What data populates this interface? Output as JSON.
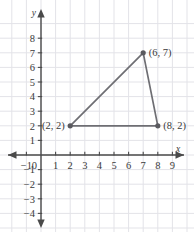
{
  "chart_data": {
    "type": "scatter",
    "title": "",
    "xlabel": "x",
    "ylabel": "y",
    "xlim": [
      -1.6,
      9.8
    ],
    "ylim": [
      -4.8,
      8.6
    ],
    "grid": true,
    "legend_position": "none",
    "x_ticks": [
      "-1",
      "0",
      "1",
      "2",
      "3",
      "4",
      "5",
      "6",
      "7",
      "8",
      "9"
    ],
    "y_ticks": [
      "8",
      "7",
      "6",
      "5",
      "4",
      "3",
      "2",
      "1",
      "-1",
      "-2",
      "-3",
      "-4"
    ],
    "origin_label": "0",
    "points": [
      {
        "label": "(2, 2)",
        "x": 2,
        "y": 2,
        "label_side": "left"
      },
      {
        "label": "(6, 7)",
        "x": 7,
        "y": 7,
        "label_side": "right"
      },
      {
        "label": "(8, 2)",
        "x": 8,
        "y": 2,
        "label_side": "right"
      }
    ],
    "shape": "triangle",
    "edges": [
      [
        0,
        1
      ],
      [
        1,
        2
      ],
      [
        2,
        0
      ]
    ]
  },
  "colors": {
    "grid": "#e3e3e8",
    "axis": "#4a4a4a",
    "plot_line": "#6e6e73",
    "point_fill": "#5a5a5f",
    "text": "#3a3a3a",
    "background": "#ffffff"
  },
  "axes": {
    "x_axis_name": "x",
    "y_axis_name": "y"
  }
}
